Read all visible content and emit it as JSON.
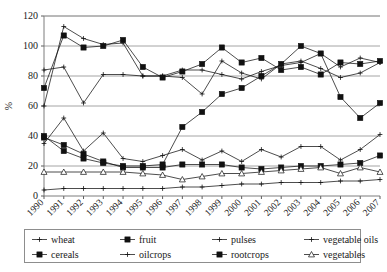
{
  "chart_data": {
    "type": "line",
    "title": "",
    "subtitle": "",
    "xlabel": "",
    "ylabel": "%",
    "ylim": [
      0,
      120
    ],
    "ytick_values": [
      0,
      20,
      40,
      60,
      80,
      100,
      120
    ],
    "ytick_labels": [
      "0",
      "20",
      "40",
      "60",
      "80",
      "100",
      "120"
    ],
    "grid": true,
    "grid_axis": "y",
    "legend_position": "bottom",
    "legend_columns": 4,
    "x": [
      1990,
      1991,
      1992,
      1993,
      1994,
      1995,
      1996,
      1997,
      1998,
      1999,
      2000,
      2001,
      2002,
      2003,
      2004,
      2005,
      2006,
      2007
    ],
    "categories": [
      "1990",
      "1991",
      "1992",
      "1993",
      "1994",
      "1995",
      "1996",
      "1997",
      "1998",
      "1999",
      "2000",
      "2001",
      "2002",
      "2003",
      "2004",
      "2005",
      "2006",
      "2007"
    ],
    "series": [
      {
        "name": "wheat",
        "marker": "plus",
        "filled": false,
        "values": [
          84,
          86,
          62,
          81,
          81,
          80,
          80,
          84,
          84,
          81,
          78,
          83,
          87,
          89,
          95,
          86,
          92,
          89
        ]
      },
      {
        "name": "cereals",
        "marker": "square",
        "filled": true,
        "values": [
          72,
          107,
          99,
          100,
          104,
          86,
          79,
          83,
          88,
          99,
          89,
          92,
          84,
          86,
          81,
          89,
          88,
          90
        ]
      },
      {
        "name": "fruit",
        "marker": "square",
        "filled": true,
        "values": [
          39,
          34,
          28,
          23,
          19,
          19,
          19,
          21,
          21,
          21,
          19,
          18,
          19,
          20,
          20,
          21,
          22,
          27
        ]
      },
      {
        "name": "oilcrops",
        "marker": "plus",
        "filled": false,
        "values": [
          35,
          52,
          30,
          42,
          25,
          23,
          27,
          31,
          24,
          30,
          23,
          31,
          26,
          33,
          33,
          24,
          31,
          41
        ]
      },
      {
        "name": "pulses",
        "marker": "plus",
        "filled": false,
        "values": [
          60,
          113,
          105,
          101,
          102,
          80,
          80,
          79,
          68,
          90,
          82,
          78,
          88,
          90,
          85,
          79,
          82,
          89
        ]
      },
      {
        "name": "rootcrops",
        "marker": "square",
        "filled": true,
        "values": [
          40,
          30,
          25,
          22,
          20,
          20,
          21,
          46,
          56,
          68,
          72,
          80,
          88,
          100,
          95,
          66,
          52,
          62
        ]
      },
      {
        "name": "vegetable oils",
        "marker": "plus",
        "filled": false,
        "values": [
          4,
          5,
          5,
          5,
          5,
          5,
          5,
          6,
          6,
          7,
          8,
          8,
          9,
          9,
          9,
          10,
          10,
          11
        ]
      },
      {
        "name": "vegetables",
        "marker": "triangle",
        "filled": false,
        "values": [
          16,
          16,
          16,
          16,
          16,
          15,
          14,
          11,
          13,
          15,
          15,
          16,
          17,
          18,
          19,
          15,
          19,
          16
        ]
      }
    ]
  },
  "legend": {
    "entries": [
      {
        "label": "wheat",
        "marker": "plus"
      },
      {
        "label": "fruit",
        "marker": "square"
      },
      {
        "label": "pulses",
        "marker": "plus"
      },
      {
        "label": "vegetable oils",
        "marker": "plus"
      },
      {
        "label": "cereals",
        "marker": "square"
      },
      {
        "label": "oilcrops",
        "marker": "plus"
      },
      {
        "label": "rootcrops",
        "marker": "square"
      },
      {
        "label": "vegetables",
        "marker": "triangle"
      }
    ]
  },
  "axes": {
    "y_title": "%"
  },
  "colors": {
    "line": "#111111",
    "grid": "#9a9a9a",
    "frame": "#6d6d6d",
    "background": "#ffffff"
  }
}
